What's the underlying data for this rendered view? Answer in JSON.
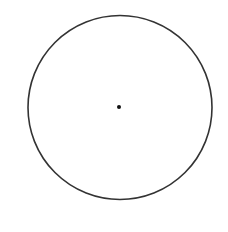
{
  "diagram": {
    "type": "circle-with-center",
    "background": "#ffffff",
    "stroke_color": "#333333",
    "circle": {
      "cx": 120,
      "cy": 107.5,
      "r": 92,
      "stroke_width": 1.6
    },
    "center_point": {
      "cx": 119,
      "cy": 107,
      "r": 2,
      "fill": "#111111"
    }
  }
}
